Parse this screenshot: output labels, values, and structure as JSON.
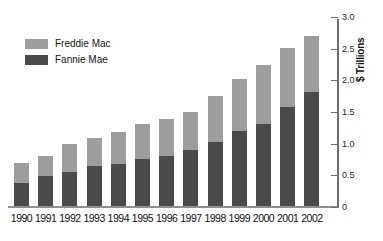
{
  "chart_data": {
    "type": "bar",
    "stacked": true,
    "title": "",
    "xlabel": "",
    "ylabel": "$ Trillions",
    "ylim": [
      0,
      3.0
    ],
    "ytick_values": [
      0,
      0.5,
      1.0,
      1.5,
      2.0,
      2.5,
      3.0
    ],
    "ytick_labels": [
      "0",
      "0.5",
      "1.0",
      "1.5",
      "2.0",
      "2.5",
      "3.0"
    ],
    "grid": false,
    "legend_position": "upper-left",
    "categories": [
      "1990",
      "1991",
      "1992",
      "1993",
      "1994",
      "1995",
      "1996",
      "1997",
      "1998",
      "1999",
      "2000",
      "2001",
      "2002"
    ],
    "series": [
      {
        "name": "Fannie Mae",
        "color": "#4a4a4a",
        "values": [
          0.39,
          0.5,
          0.57,
          0.66,
          0.69,
          0.77,
          0.82,
          0.92,
          1.04,
          1.21,
          1.32,
          1.59,
          1.83
        ]
      },
      {
        "name": "Freddie Mac",
        "color": "#9d9d9d",
        "values": [
          0.32,
          0.32,
          0.44,
          0.45,
          0.51,
          0.55,
          0.59,
          0.6,
          0.73,
          0.82,
          0.94,
          0.93,
          0.89
        ]
      }
    ],
    "totals": [
      0.71,
      0.82,
      1.01,
      1.11,
      1.2,
      1.32,
      1.41,
      1.52,
      1.77,
      2.03,
      2.26,
      2.52,
      2.72
    ]
  },
  "legend": {
    "items": [
      {
        "label": "Freddie Mac",
        "color": "#9d9d9d"
      },
      {
        "label": "Fannie Mae",
        "color": "#4a4a4a"
      }
    ]
  },
  "axis": {
    "y_title": "$ Trillions"
  }
}
